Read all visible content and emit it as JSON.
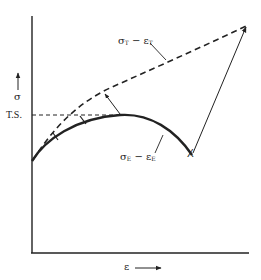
{
  "diagram": {
    "title": "",
    "y_axis": {
      "label": "σ",
      "arrow": "up-arrow"
    },
    "x_axis": {
      "label": "ε",
      "arrow": "right-arrow"
    },
    "reference_line": {
      "label": "T.S."
    },
    "curves": [
      {
        "id": "true",
        "label_main": "σ",
        "label_sub1": "T",
        "label_dash": " − ε",
        "label_sub2": "T",
        "style": "dashed"
      },
      {
        "id": "engineering",
        "label_main": "σ",
        "label_sub1": "E",
        "label_dash": " − ε",
        "label_sub2": "E",
        "style": "solid"
      }
    ],
    "fracture_marker": "X",
    "colors": {
      "ink": "#222222",
      "background": "#ffffff"
    }
  }
}
